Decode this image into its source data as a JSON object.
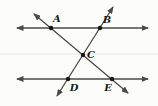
{
  "figure": {
    "points": [
      {
        "label": "A",
        "on": "upper parallel line"
      },
      {
        "label": "B",
        "on": "upper parallel line"
      },
      {
        "label": "C",
        "on": "intersection of the two transversals"
      },
      {
        "label": "D",
        "on": "lower parallel line"
      },
      {
        "label": "E",
        "on": "lower parallel line"
      }
    ],
    "lines": [
      {
        "name": "upper parallel line",
        "through": [
          "A",
          "B"
        ],
        "arrows": "both ends"
      },
      {
        "name": "lower parallel line",
        "through": [
          "D",
          "E"
        ],
        "arrows": "both ends"
      },
      {
        "name": "transversal 1",
        "through": [
          "A",
          "C",
          "E"
        ],
        "arrows": "both ends"
      },
      {
        "name": "transversal 2",
        "through": [
          "B",
          "C",
          "D"
        ],
        "arrows": "both ends"
      }
    ]
  },
  "colors": {
    "background": "#fcfcfa",
    "line": "#4a4a4a",
    "faint_line": "#e8e8e2",
    "point": "#161616",
    "label": "#1d1d1d"
  }
}
